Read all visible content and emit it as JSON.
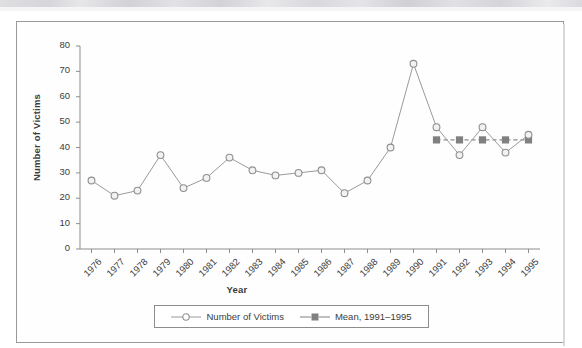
{
  "figure": {
    "ylabel": "Number of Victims",
    "xlabel": "Year"
  },
  "legend": {
    "entries": [
      {
        "label": "Number of Victims",
        "marker": "open-circle-marker",
        "color": "#9a9a9a",
        "style": "solid"
      },
      {
        "label": "Mean, 1991–1995",
        "marker": "filled-square-marker",
        "color": "#808080",
        "style": "dashed"
      }
    ]
  },
  "chart_data": {
    "type": "line",
    "title": "",
    "xlabel": "Year",
    "ylabel": "Number of Victims",
    "ylim": [
      0,
      80
    ],
    "yticks": [
      0,
      10,
      20,
      30,
      40,
      50,
      60,
      70,
      80
    ],
    "grid": false,
    "legend_position": "bottom",
    "categories": [
      "1976",
      "1977",
      "1978",
      "1979",
      "1980",
      "1981",
      "1982",
      "1983",
      "1984",
      "1985",
      "1986",
      "1987",
      "1988",
      "1989",
      "1990",
      "1991",
      "1992",
      "1993",
      "1994",
      "1995"
    ],
    "series": [
      {
        "name": "Number of Victims",
        "marker": "open-circle",
        "color": "#9a9a9a",
        "values": [
          27,
          21,
          23,
          37,
          24,
          28,
          36,
          31,
          29,
          30,
          31,
          22,
          27,
          40,
          73,
          48,
          37,
          48,
          38,
          45
        ]
      },
      {
        "name": "Mean, 1991–1995",
        "marker": "filled-square",
        "color": "#808080",
        "x": [
          "1991",
          "1992",
          "1993",
          "1994",
          "1995"
        ],
        "values": [
          43,
          43,
          43,
          43,
          43
        ]
      }
    ]
  }
}
